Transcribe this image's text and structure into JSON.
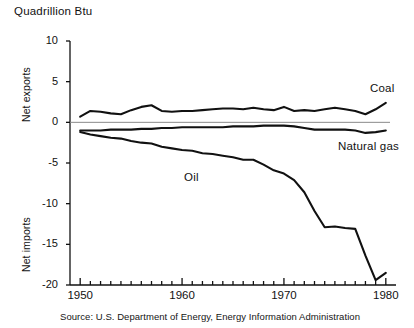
{
  "figure": {
    "unit_title": "Quadrillion Btu",
    "source_note": "Source: U.S. Department of Energy, Energy Information Administration",
    "y_axis_upper_label": "Net exports",
    "y_axis_lower_label": "Net imports"
  },
  "labels": {
    "coal": "Coal",
    "natural_gas": "Natural gas",
    "oil": "Oil"
  },
  "ticks": {
    "y": [
      "10",
      "5",
      "0",
      "-5",
      "-10",
      "-15",
      "-20"
    ],
    "x": [
      "1950",
      "1960",
      "1970",
      "1980"
    ]
  },
  "colors": {
    "series_line": "#111111",
    "zero_line": "#8a8a8a",
    "axis": "#111111",
    "background": "#ffffff"
  },
  "chart_data": {
    "type": "line",
    "title": "Quadrillion Btu",
    "xlabel": "",
    "ylabel": "Quadrillion Btu",
    "ylim": [
      -20,
      10
    ],
    "xlim": [
      1949,
      1981
    ],
    "grid": false,
    "legend": "inline-labels",
    "yticks": [
      10,
      5,
      0,
      -5,
      -10,
      -15,
      -20
    ],
    "xticks": [
      1950,
      1960,
      1970,
      1980
    ],
    "x_minor_tick_interval": 1,
    "annotations": [
      {
        "text": "Net exports",
        "axis": "y",
        "region": "above-zero"
      },
      {
        "text": "Net imports",
        "axis": "y",
        "region": "below-zero"
      },
      {
        "text": "Source: U.S. Department of Energy, Energy Information Administration",
        "position": "below-axis"
      }
    ],
    "x": [
      1950,
      1951,
      1952,
      1953,
      1954,
      1955,
      1956,
      1957,
      1958,
      1959,
      1960,
      1961,
      1962,
      1963,
      1964,
      1965,
      1966,
      1967,
      1968,
      1969,
      1970,
      1971,
      1972,
      1973,
      1974,
      1975,
      1976,
      1977,
      1978,
      1979,
      1980
    ],
    "series": [
      {
        "name": "Coal",
        "values": [
          0.7,
          1.4,
          1.3,
          1.1,
          1.0,
          1.5,
          1.9,
          2.1,
          1.4,
          1.3,
          1.4,
          1.4,
          1.5,
          1.6,
          1.7,
          1.7,
          1.6,
          1.8,
          1.6,
          1.5,
          1.9,
          1.4,
          1.5,
          1.4,
          1.6,
          1.8,
          1.6,
          1.4,
          1.0,
          1.6,
          2.4
        ]
      },
      {
        "name": "Natural gas",
        "values": [
          -1.0,
          -1.0,
          -1.0,
          -0.9,
          -0.9,
          -0.9,
          -0.8,
          -0.8,
          -0.7,
          -0.7,
          -0.6,
          -0.6,
          -0.6,
          -0.6,
          -0.6,
          -0.5,
          -0.5,
          -0.5,
          -0.4,
          -0.4,
          -0.4,
          -0.5,
          -0.7,
          -0.9,
          -0.9,
          -0.9,
          -0.9,
          -1.0,
          -1.3,
          -1.2,
          -1.0
        ]
      },
      {
        "name": "Oil",
        "values": [
          -1.2,
          -1.5,
          -1.7,
          -1.9,
          -2.0,
          -2.3,
          -2.5,
          -2.6,
          -3.0,
          -3.2,
          -3.4,
          -3.5,
          -3.8,
          -3.9,
          -4.1,
          -4.3,
          -4.6,
          -4.6,
          -5.2,
          -5.9,
          -6.3,
          -7.1,
          -8.6,
          -10.9,
          -12.9,
          -12.8,
          -13.0,
          -13.1,
          -16.4,
          -19.4,
          -18.5
        ]
      }
    ]
  }
}
